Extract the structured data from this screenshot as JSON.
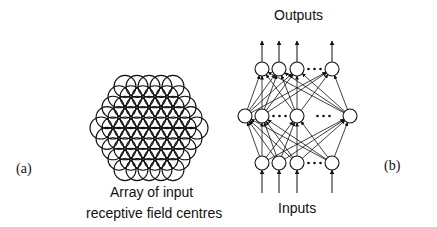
{
  "panel_a": {
    "label": "(a)",
    "caption_line1": "Array of input",
    "caption_line2": "receptive field centres",
    "hex_grid": {
      "center": [
        149,
        128
      ],
      "spacing": 12,
      "circles_per_edge": 5,
      "circle_radius": 11
    }
  },
  "panel_b": {
    "label": "(b)",
    "top_label": "Outputs",
    "bottom_label": "Inputs",
    "node_radius": 7,
    "layers": {
      "output": {
        "y": 69,
        "x": [
          262,
          279,
          297,
          332
        ],
        "ellipsis_between": [
          2,
          3
        ]
      },
      "hidden": {
        "y": 116,
        "x": [
          245,
          262,
          297,
          350
        ],
        "ellipsis_between": [
          [
            1,
            2
          ],
          [
            2,
            3
          ]
        ]
      },
      "input": {
        "y": 163,
        "x": [
          262,
          279,
          297,
          332
        ],
        "ellipsis_between": [
          2,
          3
        ]
      }
    },
    "ellipsis": "• • •"
  },
  "colors": {
    "ink": "#111111",
    "background": "#ffffff"
  }
}
